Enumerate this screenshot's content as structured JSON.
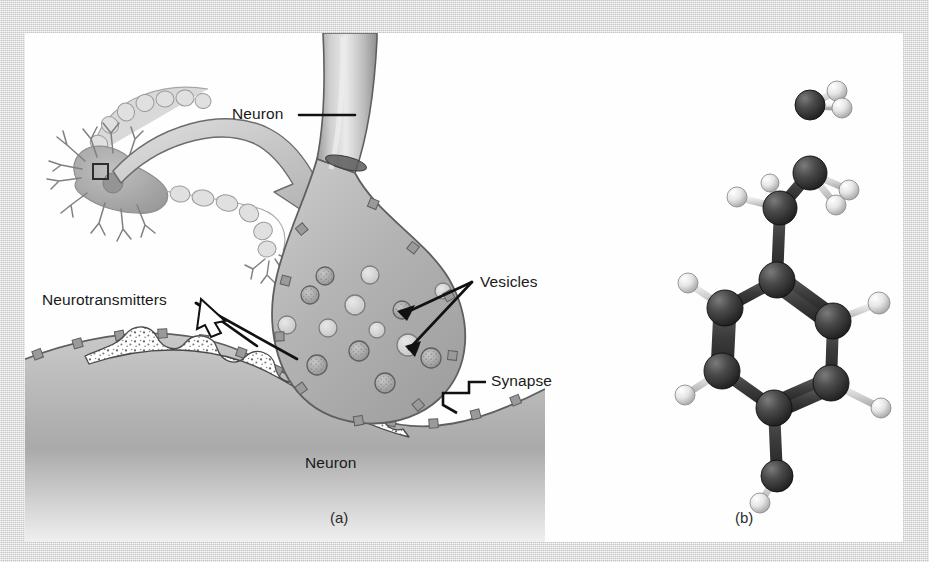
{
  "figure": {
    "background_color": "#d5d5d5",
    "panel_color": "#fefefe",
    "ink_color": "#1a1a1a"
  },
  "panel_a": {
    "caption": "(a)",
    "labels": {
      "neuron_top": "Neuron",
      "neuron_bottom": "Neuron",
      "neurotransmitters": "Neurotransmitters",
      "vesicles": "Vesicles",
      "synapse": "Synapse"
    },
    "description": "Schematic of a neuron with an enlarged view of the axon terminal forming a synapse, showing synaptic vesicles and neurotransmitters released into the synaptic cleft.",
    "vesicles": [
      {
        "cx": 300,
        "cy": 243,
        "r": 9,
        "filled": true
      },
      {
        "cx": 345,
        "cy": 242,
        "r": 9,
        "filled": false
      },
      {
        "cx": 285,
        "cy": 262,
        "r": 9,
        "filled": true
      },
      {
        "cx": 330,
        "cy": 272,
        "r": 10,
        "filled": false
      },
      {
        "cx": 377,
        "cy": 277,
        "r": 9,
        "filled": true
      },
      {
        "cx": 262,
        "cy": 292,
        "r": 9,
        "filled": false
      },
      {
        "cx": 303,
        "cy": 295,
        "r": 9,
        "filled": false
      },
      {
        "cx": 352,
        "cy": 297,
        "r": 8,
        "filled": false
      },
      {
        "cx": 334,
        "cy": 318,
        "r": 10,
        "filled": true
      },
      {
        "cx": 383,
        "cy": 312,
        "r": 11,
        "filled": false
      },
      {
        "cx": 292,
        "cy": 332,
        "r": 10,
        "filled": true
      },
      {
        "cx": 406,
        "cy": 325,
        "r": 10,
        "filled": true
      },
      {
        "cx": 360,
        "cy": 350,
        "r": 10,
        "filled": true
      },
      {
        "cx": 418,
        "cy": 258,
        "r": 8,
        "filled": false
      }
    ]
  },
  "panel_b": {
    "caption": "(b)",
    "description": "Ball-and-stick three dimensional model of a neurotransmitter molecule: a hydroxyl substituted aromatic ring attached to an ethylamine side chain.",
    "atom_colors": {
      "carbon": "#3a3a3a",
      "nitrogen": "#3a3a3a",
      "oxygen": "#3a3a3a",
      "hydrogen": "#f2f2f2"
    },
    "atoms": [
      {
        "id": "N1",
        "element": "N",
        "x": 785,
        "y": 72,
        "r": 15
      },
      {
        "id": "H1",
        "element": "H",
        "x": 812,
        "y": 58,
        "r": 10
      },
      {
        "id": "H2",
        "element": "H",
        "x": 817,
        "y": 75,
        "r": 10
      },
      {
        "id": "C1",
        "element": "C",
        "x": 785,
        "y": 140,
        "r": 17
      },
      {
        "id": "H3",
        "element": "H",
        "x": 824,
        "y": 157,
        "r": 10
      },
      {
        "id": "H4",
        "element": "H",
        "x": 811,
        "y": 172,
        "r": 10
      },
      {
        "id": "C2",
        "element": "C",
        "x": 755,
        "y": 175,
        "r": 17
      },
      {
        "id": "H5",
        "element": "H",
        "x": 712,
        "y": 164,
        "r": 10
      },
      {
        "id": "H6",
        "element": "H",
        "x": 745,
        "y": 150,
        "r": 9
      },
      {
        "id": "C3",
        "element": "C",
        "x": 752,
        "y": 247,
        "r": 18
      },
      {
        "id": "C4",
        "element": "C",
        "x": 700,
        "y": 275,
        "r": 18
      },
      {
        "id": "H7",
        "element": "H",
        "x": 663,
        "y": 250,
        "r": 10
      },
      {
        "id": "C5",
        "element": "C",
        "x": 697,
        "y": 338,
        "r": 18
      },
      {
        "id": "H8",
        "element": "H",
        "x": 660,
        "y": 362,
        "r": 10
      },
      {
        "id": "C6",
        "element": "C",
        "x": 749,
        "y": 375,
        "r": 18
      },
      {
        "id": "C7",
        "element": "C",
        "x": 806,
        "y": 350,
        "r": 18
      },
      {
        "id": "H9",
        "element": "H",
        "x": 856,
        "y": 375,
        "r": 10
      },
      {
        "id": "C8",
        "element": "C",
        "x": 808,
        "y": 288,
        "r": 18
      },
      {
        "id": "H10",
        "element": "H",
        "x": 854,
        "y": 270,
        "r": 11
      },
      {
        "id": "O1",
        "element": "O",
        "x": 752,
        "y": 443,
        "r": 16
      },
      {
        "id": "H11",
        "element": "H",
        "x": 735,
        "y": 470,
        "r": 10
      }
    ],
    "bonds": [
      {
        "from": "N1",
        "to": "C1",
        "order": 1
      },
      {
        "from": "N1",
        "to": "H1",
        "order": 1
      },
      {
        "from": "N1",
        "to": "H2",
        "order": 1
      },
      {
        "from": "C1",
        "to": "C2",
        "order": 1
      },
      {
        "from": "C1",
        "to": "H3",
        "order": 1
      },
      {
        "from": "C1",
        "to": "H4",
        "order": 1
      },
      {
        "from": "C2",
        "to": "C3",
        "order": 1
      },
      {
        "from": "C2",
        "to": "H5",
        "order": 1
      },
      {
        "from": "C2",
        "to": "H6",
        "order": 1
      },
      {
        "from": "C3",
        "to": "C4",
        "order": 1
      },
      {
        "from": "C3",
        "to": "C8",
        "order": 2
      },
      {
        "from": "C4",
        "to": "C5",
        "order": 2
      },
      {
        "from": "C4",
        "to": "H7",
        "order": 1
      },
      {
        "from": "C5",
        "to": "C6",
        "order": 1
      },
      {
        "from": "C5",
        "to": "H8",
        "order": 1
      },
      {
        "from": "C6",
        "to": "C7",
        "order": 2
      },
      {
        "from": "C6",
        "to": "O1",
        "order": 1
      },
      {
        "from": "C7",
        "to": "C8",
        "order": 1
      },
      {
        "from": "C7",
        "to": "H9",
        "order": 1
      },
      {
        "from": "C8",
        "to": "H10",
        "order": 1
      },
      {
        "from": "O1",
        "to": "H11",
        "order": 1
      }
    ]
  }
}
